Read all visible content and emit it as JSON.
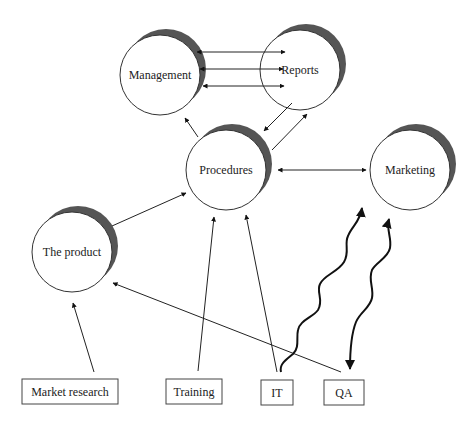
{
  "diagram": {
    "nodes": [
      {
        "id": "management",
        "label": "Management",
        "shape": "circle",
        "cx": 160,
        "cy": 75,
        "r": 40
      },
      {
        "id": "reports",
        "label": "Reports",
        "shape": "circle",
        "cx": 300,
        "cy": 70,
        "r": 40
      },
      {
        "id": "procedures",
        "label": "Procedures",
        "shape": "circle",
        "cx": 226,
        "cy": 170,
        "r": 40
      },
      {
        "id": "marketing",
        "label": "Marketing",
        "shape": "circle",
        "cx": 410,
        "cy": 170,
        "r": 40
      },
      {
        "id": "the-product",
        "label": "The product",
        "shape": "circle",
        "cx": 72,
        "cy": 252,
        "r": 40
      }
    ],
    "boxes": [
      {
        "id": "market-research",
        "label": "Market research",
        "x": 22,
        "y": 379,
        "w": 96,
        "h": 25
      },
      {
        "id": "training",
        "label": "Training",
        "x": 166,
        "y": 379,
        "w": 56,
        "h": 25
      },
      {
        "id": "it",
        "label": "IT",
        "x": 261,
        "y": 380,
        "w": 32,
        "h": 25
      },
      {
        "id": "qa",
        "label": "QA",
        "x": 324,
        "y": 380,
        "w": 40,
        "h": 25
      }
    ],
    "edges": [
      {
        "from": "management",
        "to": "reports",
        "style": "bidirectional",
        "count": 3
      },
      {
        "from": "reports",
        "to": "procedures",
        "style": "arrow"
      },
      {
        "from": "procedures",
        "to": "reports",
        "style": "arrow"
      },
      {
        "from": "procedures",
        "to": "management",
        "style": "arrow"
      },
      {
        "from": "procedures",
        "to": "marketing",
        "style": "bidirectional"
      },
      {
        "from": "the-product",
        "to": "procedures",
        "style": "arrow"
      },
      {
        "from": "market-research",
        "to": "the-product",
        "style": "arrow"
      },
      {
        "from": "training",
        "to": "procedures",
        "style": "arrow"
      },
      {
        "from": "it",
        "to": "procedures",
        "style": "arrow"
      },
      {
        "from": "qa",
        "to": "the-product",
        "style": "arrow"
      },
      {
        "from": "it",
        "to": "marketing",
        "style": "wavy-arrow"
      },
      {
        "from": "marketing",
        "to": "qa",
        "style": "wavy-bidirectional"
      }
    ]
  }
}
